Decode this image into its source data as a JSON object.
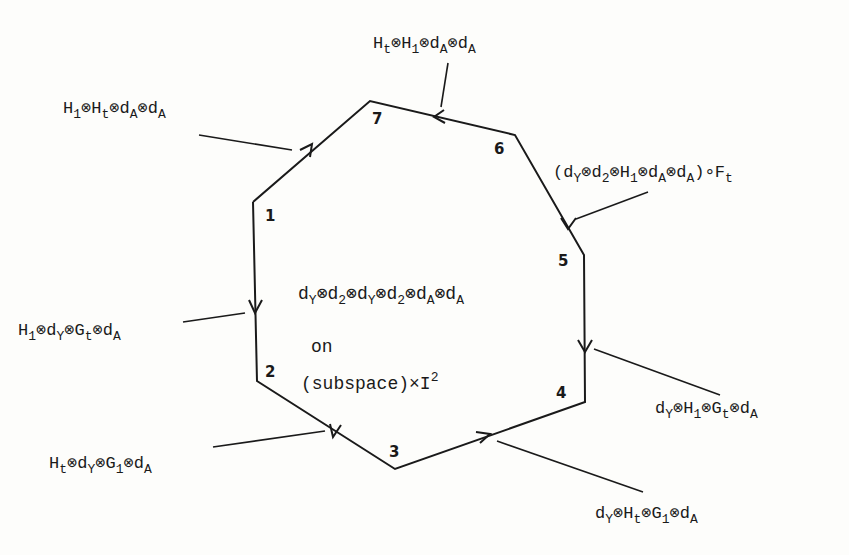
{
  "diagram": {
    "type": "octagon-cycle",
    "center": {
      "expression": "dY⊗d2⊗dY⊗d2⊗dA⊗dA",
      "on": "on",
      "space": "(subspace)×I",
      "space_sup": "2"
    },
    "vertices": [
      {
        "id": "1",
        "x": 253,
        "y": 202
      },
      {
        "id": "2",
        "x": 257,
        "y": 381
      },
      {
        "id": "3",
        "x": 395,
        "y": 469
      },
      {
        "id": "4",
        "x": 585,
        "y": 402
      },
      {
        "id": "5",
        "x": 584,
        "y": 255
      },
      {
        "id": "6",
        "x": 515,
        "y": 135
      },
      {
        "id": "7",
        "x": 370,
        "y": 101
      }
    ],
    "edges": [
      {
        "from": "1",
        "to": "2",
        "label": "H1⊗dY⊗Gt⊗dA"
      },
      {
        "from": "2",
        "to": "3",
        "label": "Ht⊗dY⊗G1⊗dA",
        "direction": "3→2"
      },
      {
        "from": "3",
        "to": "4",
        "label": "dY⊗Ht⊗G1⊗dA"
      },
      {
        "from": "5",
        "to": "4",
        "label": "dY⊗H1⊗Gt⊗dA"
      },
      {
        "from": "6",
        "to": "5",
        "label": "(dY⊗d2⊗H1⊗dA⊗dA)∘Ft"
      },
      {
        "from": "6",
        "to": "7",
        "label": "Ht⊗H1⊗dA⊗dA"
      },
      {
        "from": "1",
        "to": "7",
        "label": "H1⊗Ht⊗dA⊗dA"
      }
    ],
    "vertex_labels": {
      "v1": "1",
      "v2": "2",
      "v3": "3",
      "v4": "4",
      "v5": "5",
      "v6": "6",
      "v7": "7"
    },
    "edge_labels": {
      "e12": {
        "a": "H",
        "a_sub": "1",
        "b": "d",
        "b_sub": "Y",
        "c": "G",
        "c_sub": "t",
        "d": "d",
        "d_sub": "A"
      },
      "e23": {
        "a": "H",
        "a_sub": "t",
        "b": "d",
        "b_sub": "Y",
        "c": "G",
        "c_sub": "1",
        "d": "d",
        "d_sub": "A"
      },
      "e34": {
        "a": "d",
        "a_sub": "Y",
        "b": "H",
        "b_sub": "t",
        "c": "G",
        "c_sub": "1",
        "d": "d",
        "d_sub": "A"
      },
      "e54": {
        "a": "d",
        "a_sub": "Y",
        "b": "H",
        "b_sub": "1",
        "c": "G",
        "c_sub": "t",
        "d": "d",
        "d_sub": "A"
      },
      "e65": {
        "open": "(",
        "a": "d",
        "a_sub": "Y",
        "b": "d",
        "b_sub": "2",
        "c": "H",
        "c_sub": "1",
        "d": "d",
        "d_sub": "A",
        "e": "d",
        "e_sub": "A",
        "close": ")∘F",
        "close_sub": "t"
      },
      "e67": {
        "a": "H",
        "a_sub": "t",
        "b": "H",
        "b_sub": "1",
        "c": "d",
        "c_sub": "A",
        "d": "d",
        "d_sub": "A"
      },
      "e17": {
        "a": "H",
        "a_sub": "1",
        "b": "H",
        "b_sub": "t",
        "c": "d",
        "c_sub": "A",
        "d": "d",
        "d_sub": "A"
      }
    },
    "tensor_symbol": "⊗",
    "colors": {
      "ink": "#1a1a1a",
      "paper": "#fdfdfb"
    }
  }
}
